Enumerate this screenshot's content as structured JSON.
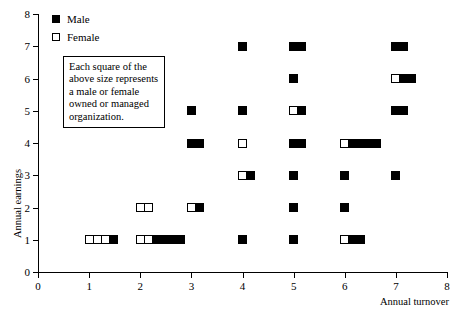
{
  "chart_data": {
    "type": "scatter",
    "title": "",
    "xlabel": "Annual turnover",
    "ylabel": "Annual earnings",
    "xlim": [
      0,
      8
    ],
    "ylim": [
      0,
      8
    ],
    "xticks": [
      "0",
      "1",
      "2",
      "3",
      "4",
      "5",
      "6",
      "7",
      "8"
    ],
    "yticks": [
      "0",
      "1",
      "2",
      "3",
      "4",
      "5",
      "6",
      "7",
      "8"
    ],
    "grid": false,
    "legend_position": "top-left",
    "marker_note": "Each square represents one male or female owned/managed organization; squares are stacked horizontally to the right of the x value.",
    "series": [
      {
        "name": "Male",
        "color": "#000000",
        "fill": "solid"
      },
      {
        "name": "Female",
        "color": "#ffffff",
        "fill": "open"
      }
    ],
    "points": [
      {
        "x": 1,
        "y": 1,
        "female": 3,
        "male": 1
      },
      {
        "x": 2,
        "y": 1,
        "female": 2,
        "male": 4
      },
      {
        "x": 4,
        "y": 1,
        "female": 0,
        "male": 1
      },
      {
        "x": 5,
        "y": 1,
        "female": 0,
        "male": 1
      },
      {
        "x": 6,
        "y": 1,
        "female": 1,
        "male": 2
      },
      {
        "x": 2,
        "y": 2,
        "female": 2,
        "male": 0
      },
      {
        "x": 3,
        "y": 2,
        "female": 1,
        "male": 1
      },
      {
        "x": 5,
        "y": 2,
        "female": 0,
        "male": 1
      },
      {
        "x": 6,
        "y": 2,
        "female": 0,
        "male": 1
      },
      {
        "x": 4,
        "y": 3,
        "female": 1,
        "male": 1
      },
      {
        "x": 5,
        "y": 3,
        "female": 0,
        "male": 1
      },
      {
        "x": 6,
        "y": 3,
        "female": 0,
        "male": 1
      },
      {
        "x": 7,
        "y": 3,
        "female": 0,
        "male": 1
      },
      {
        "x": 3,
        "y": 4,
        "female": 0,
        "male": 2
      },
      {
        "x": 4,
        "y": 4,
        "female": 1,
        "male": 0
      },
      {
        "x": 5,
        "y": 4,
        "female": 0,
        "male": 2
      },
      {
        "x": 6,
        "y": 4,
        "female": 1,
        "male": 4
      },
      {
        "x": 3,
        "y": 5,
        "female": 0,
        "male": 1
      },
      {
        "x": 4,
        "y": 5,
        "female": 0,
        "male": 1
      },
      {
        "x": 5,
        "y": 5,
        "female": 1,
        "male": 1
      },
      {
        "x": 7,
        "y": 5,
        "female": 0,
        "male": 2
      },
      {
        "x": 5,
        "y": 6,
        "female": 0,
        "male": 1
      },
      {
        "x": 7,
        "y": 6,
        "female": 1,
        "male": 2
      },
      {
        "x": 4,
        "y": 7,
        "female": 0,
        "male": 1
      },
      {
        "x": 5,
        "y": 7,
        "female": 0,
        "male": 2
      },
      {
        "x": 7,
        "y": 7,
        "female": 0,
        "male": 2
      }
    ]
  },
  "legend": {
    "male_label": "Male",
    "female_label": "Female"
  },
  "note": {
    "text": "Each square of the above size represents a male or female owned or managed organization."
  },
  "axes": {
    "x_title": "Annual turnover",
    "y_title": "Annual earnings"
  }
}
